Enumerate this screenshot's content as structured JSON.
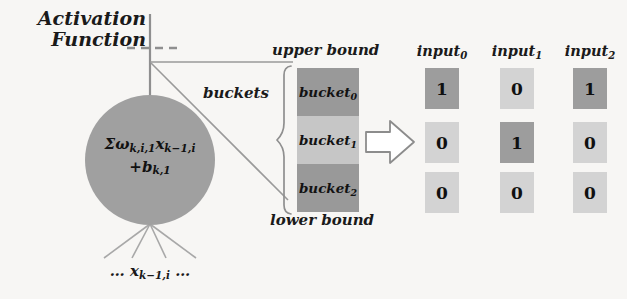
{
  "annotations": {
    "activation_function_line1": "Activation",
    "activation_function_line2": "Function",
    "upper_bound": "upper bound",
    "lower_bound": "lower bound",
    "buckets": "buckets"
  },
  "neuron": {
    "formula_line1": "Σωk,i,1 xk−1,i",
    "formula_line2": "+bk,1",
    "inputs_label": "… xk−1,i …",
    "fill_color": "#a0a0a0"
  },
  "buckets": {
    "items": [
      {
        "label": "bucket0",
        "color": "#999999"
      },
      {
        "label": "bucket1",
        "color": "#c6c6c6"
      },
      {
        "label": "bucket2",
        "color": "#999999"
      }
    ]
  },
  "matrix": {
    "columns": [
      "input0",
      "input1",
      "input2"
    ],
    "rows": [
      {
        "values": [
          "1",
          "0",
          "1"
        ]
      },
      {
        "values": [
          "0",
          "1",
          "0"
        ]
      },
      {
        "values": [
          "0",
          "0",
          "0"
        ]
      }
    ],
    "on_color": "#9d9d9d",
    "off_color": "#d3d3d3"
  },
  "colors": {
    "line": "#8c8c8c",
    "text": "#111111",
    "background": "#f7f6f4"
  }
}
